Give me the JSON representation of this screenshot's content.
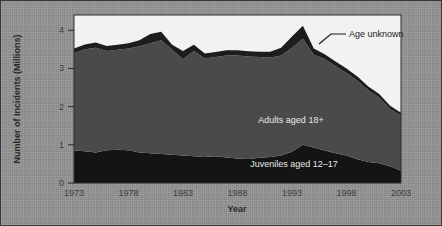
{
  "chart_data": {
    "type": "area",
    "stacked": true,
    "title": "",
    "xlabel": "Year",
    "ylabel": "Number of Incidents (Millions)",
    "xlim": [
      1973,
      2003
    ],
    "ylim": [
      0,
      4.4
    ],
    "yticks": [
      0,
      1,
      2,
      3,
      4
    ],
    "ytick_labels": [
      "0",
      "1",
      "2",
      "3",
      "4"
    ],
    "xticks": [
      1973,
      1978,
      1983,
      1988,
      1993,
      1998,
      2003
    ],
    "xtick_labels": [
      "1973",
      "1978",
      "1983",
      "1988",
      "1993",
      "1998",
      "2003"
    ],
    "grid": false,
    "legend_position": "inline-annotations",
    "x": [
      1973,
      1974,
      1975,
      1976,
      1977,
      1978,
      1979,
      1980,
      1981,
      1982,
      1983,
      1984,
      1985,
      1986,
      1987,
      1988,
      1989,
      1990,
      1991,
      1992,
      1993,
      1994,
      1995,
      1996,
      1997,
      1998,
      1999,
      2000,
      2001,
      2002,
      2003
    ],
    "series": [
      {
        "name": "Juveniles aged 12–17",
        "color": "#141414",
        "values": [
          0.85,
          0.83,
          0.8,
          0.86,
          0.87,
          0.86,
          0.8,
          0.78,
          0.76,
          0.74,
          0.72,
          0.7,
          0.68,
          0.7,
          0.67,
          0.64,
          0.63,
          0.66,
          0.68,
          0.72,
          0.82,
          1.0,
          0.93,
          0.85,
          0.78,
          0.72,
          0.62,
          0.55,
          0.52,
          0.44,
          0.32
        ]
      },
      {
        "name": "Adults aged 18+",
        "color": "#4a4a4a",
        "values": [
          2.55,
          2.67,
          2.74,
          2.6,
          2.62,
          2.66,
          2.78,
          2.88,
          2.98,
          2.75,
          2.52,
          2.76,
          2.58,
          2.6,
          2.67,
          2.7,
          2.68,
          2.64,
          2.6,
          2.62,
          2.72,
          2.78,
          2.43,
          2.4,
          2.28,
          2.16,
          2.06,
          1.88,
          1.72,
          1.5,
          1.45
        ]
      },
      {
        "name": "Age unknown",
        "color": "#1d1d1d",
        "values": [
          0.12,
          0.13,
          0.14,
          0.13,
          0.13,
          0.14,
          0.16,
          0.24,
          0.22,
          0.13,
          0.22,
          0.16,
          0.13,
          0.13,
          0.14,
          0.14,
          0.14,
          0.14,
          0.16,
          0.2,
          0.3,
          0.34,
          0.16,
          0.12,
          0.12,
          0.12,
          0.11,
          0.1,
          0.09,
          0.08,
          0.07
        ]
      }
    ],
    "annotations": [
      {
        "text": "Age unknown",
        "x": 1994,
        "y": 4.0,
        "style": "callout-with-leader"
      },
      {
        "text": "Adults aged 18+",
        "x": 1990,
        "y": 2.0,
        "style": "inline"
      },
      {
        "text": "Juveniles aged 12–17",
        "x": 1992,
        "y": 0.45,
        "style": "inline"
      }
    ],
    "colors": {
      "plot_background": "#f2f2f2",
      "juveniles": "#141414",
      "adults": "#4a4a4a",
      "age_unknown": "#1d1d1d",
      "axis": "#2a2a2a",
      "page_background": "#929292"
    }
  }
}
